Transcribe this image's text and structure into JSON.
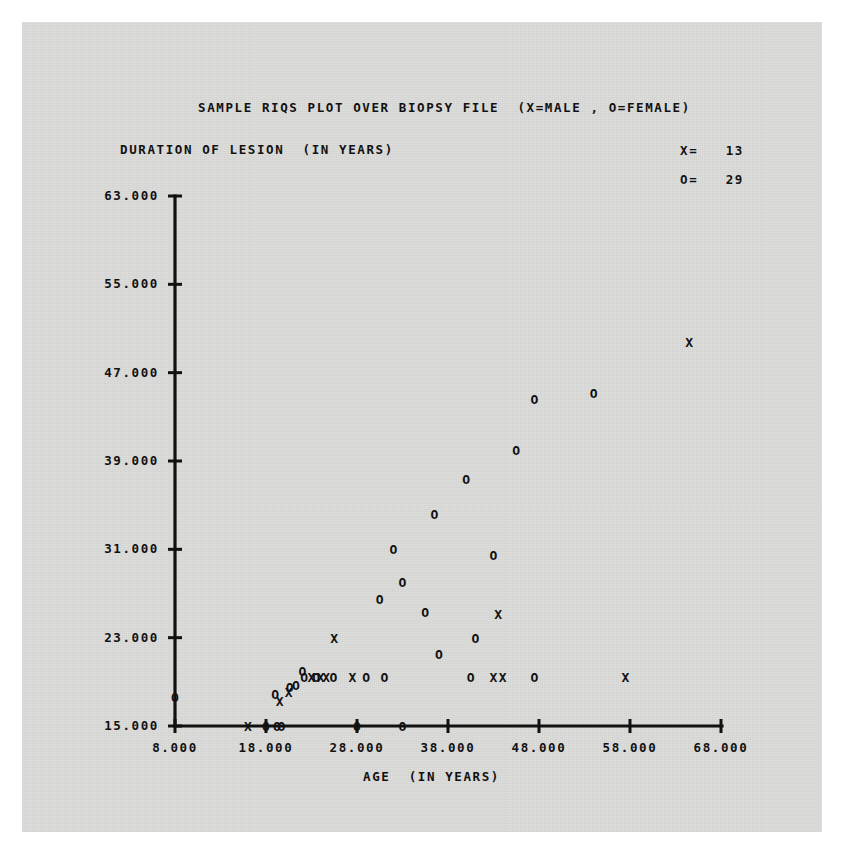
{
  "page": {
    "background_color": "#ffffff",
    "scan_color": "#dcdcda",
    "ink_color": "#111111"
  },
  "chart_data": {
    "type": "scatter",
    "title": "SAMPLE RIQS PLOT OVER BIOPSY FILE  (X=MALE , O=FEMALE)",
    "xlabel": "AGE  (IN YEARS)",
    "ylabel": "DURATION OF LESION  (IN YEARS)",
    "xlim": [
      8,
      68
    ],
    "ylim": [
      15,
      63
    ],
    "xticks": [
      8,
      18,
      28,
      38,
      48,
      58,
      68
    ],
    "xtick_labels": [
      "8.000",
      "18.000",
      "28.000",
      "38.000",
      "48.000",
      "58.000",
      "68.000"
    ],
    "yticks": [
      15,
      23,
      31,
      39,
      47,
      55,
      63
    ],
    "ytick_labels": [
      "15.000",
      "23.000",
      "31.000",
      "39.000",
      "47.000",
      "55.000",
      "63.000"
    ],
    "grid": false,
    "legend_position": "top-right",
    "legend": [
      {
        "symbol": "X",
        "label": "MALE",
        "count_label": "X=   13",
        "count": 13
      },
      {
        "symbol": "O",
        "label": "FEMALE",
        "count_label": "O=   29",
        "count": 29
      }
    ],
    "series": [
      {
        "name": "MALE",
        "symbol": "X",
        "count": 13,
        "points": [
          {
            "x": 16.0,
            "y": 15.0
          },
          {
            "x": 19.5,
            "y": 17.3
          },
          {
            "x": 20.5,
            "y": 18.1
          },
          {
            "x": 23.0,
            "y": 19.4
          },
          {
            "x": 24.0,
            "y": 19.4
          },
          {
            "x": 24.6,
            "y": 19.4
          },
          {
            "x": 27.5,
            "y": 19.4
          },
          {
            "x": 25.5,
            "y": 23.0
          },
          {
            "x": 43.0,
            "y": 19.4
          },
          {
            "x": 44.0,
            "y": 19.4
          },
          {
            "x": 43.5,
            "y": 25.1
          },
          {
            "x": 57.5,
            "y": 19.4
          },
          {
            "x": 64.5,
            "y": 49.8
          }
        ]
      },
      {
        "name": "FEMALE",
        "symbol": "O",
        "count": 29,
        "points": [
          {
            "x": 8.0,
            "y": 17.6
          },
          {
            "x": 18.0,
            "y": 15.0
          },
          {
            "x": 19.2,
            "y": 15.0
          },
          {
            "x": 19.7,
            "y": 15.0
          },
          {
            "x": 28.0,
            "y": 15.0
          },
          {
            "x": 33.0,
            "y": 15.0
          },
          {
            "x": 19.0,
            "y": 17.9
          },
          {
            "x": 20.6,
            "y": 18.5
          },
          {
            "x": 21.3,
            "y": 18.7
          },
          {
            "x": 22.2,
            "y": 19.4
          },
          {
            "x": 23.5,
            "y": 19.4
          },
          {
            "x": 25.4,
            "y": 19.4
          },
          {
            "x": 29.0,
            "y": 19.4
          },
          {
            "x": 31.0,
            "y": 19.4
          },
          {
            "x": 40.5,
            "y": 19.4
          },
          {
            "x": 47.5,
            "y": 19.4
          },
          {
            "x": 22.0,
            "y": 20.0
          },
          {
            "x": 37.0,
            "y": 21.5
          },
          {
            "x": 41.0,
            "y": 23.0
          },
          {
            "x": 35.5,
            "y": 25.3
          },
          {
            "x": 30.5,
            "y": 26.5
          },
          {
            "x": 33.0,
            "y": 28.0
          },
          {
            "x": 43.0,
            "y": 30.5
          },
          {
            "x": 32.0,
            "y": 31.0
          },
          {
            "x": 36.5,
            "y": 34.2
          },
          {
            "x": 40.0,
            "y": 37.4
          },
          {
            "x": 45.5,
            "y": 40.0
          },
          {
            "x": 47.5,
            "y": 44.6
          },
          {
            "x": 54.0,
            "y": 45.2
          }
        ]
      }
    ]
  }
}
